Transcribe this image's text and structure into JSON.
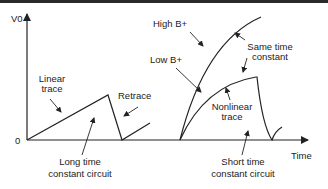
{
  "diagram": {
    "axes": {
      "y_label": "V0",
      "x_label": "Time",
      "origin_label": "0"
    },
    "left_panel": {
      "trace_label_line1": "Linear",
      "trace_label_line2": "trace",
      "retrace_label": "Retrace",
      "circuit_label_line1": "Long time",
      "circuit_label_line2": "constant circuit"
    },
    "right_panel": {
      "high_label": "High B+",
      "low_label": "Low B+",
      "same_tc_line1": "Same time",
      "same_tc_line2": "constant",
      "nonlinear_line1": "Nonlinear",
      "nonlinear_line2": "trace",
      "circuit_label_line1": "Short time",
      "circuit_label_line2": "constant circuit"
    },
    "colors": {
      "line": "#222222",
      "topbar": "#2a2a2a"
    }
  }
}
